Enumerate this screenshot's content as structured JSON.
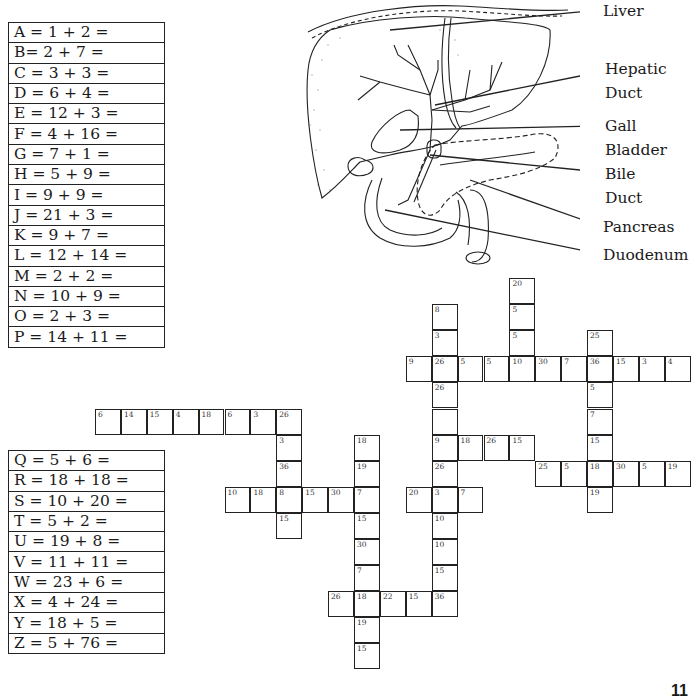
{
  "worksheet": {
    "page_number": "11",
    "key_top": [
      {
        "letter": "A",
        "equation": "A = 1 + 2 ="
      },
      {
        "letter": "B",
        "equation": "B= 2 + 7 ="
      },
      {
        "letter": "C",
        "equation": "C = 3 + 3 ="
      },
      {
        "letter": "D",
        "equation": "D = 6 + 4 ="
      },
      {
        "letter": "E",
        "equation": "E = 12 + 3 ="
      },
      {
        "letter": "F",
        "equation": "F = 4 + 16 ="
      },
      {
        "letter": "G",
        "equation": "G = 7 + 1 ="
      },
      {
        "letter": "H",
        "equation": "H = 5 + 9 ="
      },
      {
        "letter": "I",
        "equation": "I = 9 + 9 ="
      },
      {
        "letter": "J",
        "equation": "J = 21 + 3 ="
      },
      {
        "letter": "K",
        "equation": "K = 9 + 7 ="
      },
      {
        "letter": "L",
        "equation": "L = 12 + 14 ="
      },
      {
        "letter": "M",
        "equation": "M = 2 + 2 ="
      },
      {
        "letter": "N",
        "equation": "N = 10 + 9 ="
      },
      {
        "letter": "O",
        "equation": "O = 2 + 3 ="
      },
      {
        "letter": "P",
        "equation": "P = 14 + 11 ="
      }
    ],
    "key_bottom": [
      {
        "letter": "Q",
        "equation": "Q = 5 + 6 ="
      },
      {
        "letter": "R",
        "equation": "R = 18 + 18 ="
      },
      {
        "letter": "S",
        "equation": "S = 10 + 20 ="
      },
      {
        "letter": "T",
        "equation": "T = 5 + 2 ="
      },
      {
        "letter": "U",
        "equation": "U = 19 + 8 ="
      },
      {
        "letter": "V",
        "equation": "V = 11 + 11 ="
      },
      {
        "letter": "W",
        "equation": "W = 23 + 6 ="
      },
      {
        "letter": "X",
        "equation": "X = 4 + 24 ="
      },
      {
        "letter": "Y",
        "equation": "Y = 18 + 5 ="
      },
      {
        "letter": "Z",
        "equation": "Z = 5 + 76 ="
      }
    ],
    "diagram": {
      "labels": [
        {
          "id": "liver",
          "text": "Liver",
          "x": 603,
          "y": 2
        },
        {
          "id": "hepatic-duct-1",
          "text": "Hepatic",
          "x": 605,
          "y": 60
        },
        {
          "id": "hepatic-duct-2",
          "text": "Duct",
          "x": 605,
          "y": 84
        },
        {
          "id": "gall-bladder-1",
          "text": "Gall",
          "x": 605,
          "y": 117
        },
        {
          "id": "gall-bladder-2",
          "text": "Bladder",
          "x": 605,
          "y": 141
        },
        {
          "id": "bile-duct-1",
          "text": "Bile",
          "x": 605,
          "y": 165
        },
        {
          "id": "bile-duct-2",
          "text": "Duct",
          "x": 605,
          "y": 189
        },
        {
          "id": "pancreas",
          "text": "Pancreas",
          "x": 603,
          "y": 218
        },
        {
          "id": "duodenum",
          "text": "Duodenum",
          "x": 603,
          "y": 246
        }
      ]
    },
    "crossword": {
      "origin_x": 95,
      "origin_y": 278,
      "cell_w": 25.9,
      "cell_h": 26.1,
      "cells": [
        {
          "r": 0,
          "c": 16,
          "n": "20"
        },
        {
          "r": 1,
          "c": 13,
          "n": "8"
        },
        {
          "r": 1,
          "c": 16,
          "n": "5"
        },
        {
          "r": 2,
          "c": 13,
          "n": "3"
        },
        {
          "r": 2,
          "c": 16,
          "n": "5"
        },
        {
          "r": 2,
          "c": 19,
          "n": "25"
        },
        {
          "r": 3,
          "c": 12,
          "n": "9"
        },
        {
          "r": 3,
          "c": 13,
          "n": "26"
        },
        {
          "r": 3,
          "c": 14,
          "n": "5"
        },
        {
          "r": 3,
          "c": 15,
          "n": "5"
        },
        {
          "r": 3,
          "c": 16,
          "n": "10"
        },
        {
          "r": 3,
          "c": 17,
          "n": "30"
        },
        {
          "r": 3,
          "c": 18,
          "n": "7"
        },
        {
          "r": 3,
          "c": 19,
          "n": "36"
        },
        {
          "r": 3,
          "c": 20,
          "n": "15"
        },
        {
          "r": 3,
          "c": 21,
          "n": "3"
        },
        {
          "r": 3,
          "c": 22,
          "n": "4"
        },
        {
          "r": 4,
          "c": 13,
          "n": "26"
        },
        {
          "r": 4,
          "c": 19,
          "n": "5"
        },
        {
          "r": 5,
          "c": 0,
          "n": "6"
        },
        {
          "r": 5,
          "c": 1,
          "n": "14"
        },
        {
          "r": 5,
          "c": 2,
          "n": "15"
        },
        {
          "r": 5,
          "c": 3,
          "n": "4"
        },
        {
          "r": 5,
          "c": 4,
          "n": "18"
        },
        {
          "r": 5,
          "c": 5,
          "n": "6"
        },
        {
          "r": 5,
          "c": 6,
          "n": "3"
        },
        {
          "r": 5,
          "c": 7,
          "n": "26"
        },
        {
          "r": 5,
          "c": 13,
          "n": ""
        },
        {
          "r": 5,
          "c": 19,
          "n": "7"
        },
        {
          "r": 6,
          "c": 7,
          "n": "3"
        },
        {
          "r": 6,
          "c": 10,
          "n": "18"
        },
        {
          "r": 6,
          "c": 13,
          "n": "9"
        },
        {
          "r": 6,
          "c": 14,
          "n": "18"
        },
        {
          "r": 6,
          "c": 15,
          "n": "26"
        },
        {
          "r": 6,
          "c": 16,
          "n": "15"
        },
        {
          "r": 6,
          "c": 19,
          "n": "15"
        },
        {
          "r": 7,
          "c": 7,
          "n": "36"
        },
        {
          "r": 7,
          "c": 10,
          "n": "19"
        },
        {
          "r": 7,
          "c": 13,
          "n": "26"
        },
        {
          "r": 7,
          "c": 17,
          "n": "25"
        },
        {
          "r": 7,
          "c": 18,
          "n": "5"
        },
        {
          "r": 7,
          "c": 19,
          "n": "18"
        },
        {
          "r": 7,
          "c": 20,
          "n": "30"
        },
        {
          "r": 7,
          "c": 21,
          "n": "5"
        },
        {
          "r": 7,
          "c": 22,
          "n": "19"
        },
        {
          "r": 8,
          "c": 5,
          "n": "10"
        },
        {
          "r": 8,
          "c": 6,
          "n": "18"
        },
        {
          "r": 8,
          "c": 7,
          "n": "8"
        },
        {
          "r": 8,
          "c": 8,
          "n": "15"
        },
        {
          "r": 8,
          "c": 9,
          "n": "30"
        },
        {
          "r": 8,
          "c": 10,
          "n": "7"
        },
        {
          "r": 8,
          "c": 12,
          "n": "20"
        },
        {
          "r": 8,
          "c": 13,
          "n": "3"
        },
        {
          "r": 8,
          "c": 14,
          "n": "7"
        },
        {
          "r": 8,
          "c": 19,
          "n": "19"
        },
        {
          "r": 9,
          "c": 7,
          "n": "15"
        },
        {
          "r": 9,
          "c": 10,
          "n": "15"
        },
        {
          "r": 9,
          "c": 13,
          "n": "10"
        },
        {
          "r": 10,
          "c": 10,
          "n": "30"
        },
        {
          "r": 10,
          "c": 13,
          "n": "10"
        },
        {
          "r": 11,
          "c": 10,
          "n": "7"
        },
        {
          "r": 11,
          "c": 13,
          "n": "15"
        },
        {
          "r": 12,
          "c": 9,
          "n": "26"
        },
        {
          "r": 12,
          "c": 10,
          "n": "18"
        },
        {
          "r": 12,
          "c": 11,
          "n": "22"
        },
        {
          "r": 12,
          "c": 12,
          "n": "15"
        },
        {
          "r": 12,
          "c": 13,
          "n": "36"
        },
        {
          "r": 13,
          "c": 10,
          "n": "19"
        },
        {
          "r": 14,
          "c": 10,
          "n": "15"
        }
      ]
    }
  }
}
